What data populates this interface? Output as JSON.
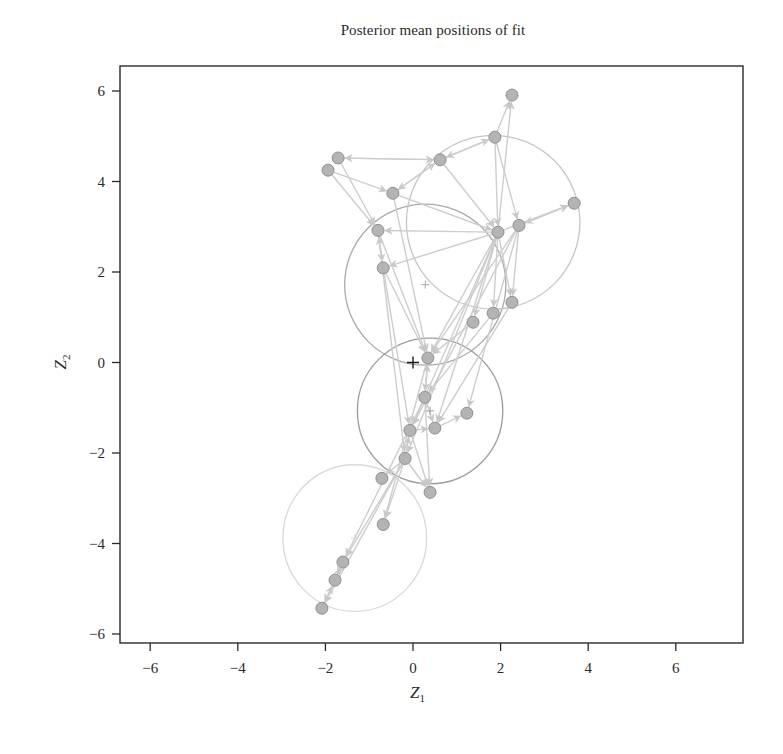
{
  "chart_data": {
    "type": "scatter",
    "title": "Posterior mean positions of fit",
    "xlabel": "Z",
    "xlabel_sub": "1",
    "ylabel": "Z",
    "ylabel_sub": "2",
    "xlim": [
      -6.75,
      7.6
    ],
    "ylim": [
      -6.25,
      6.3
    ],
    "xticks": [
      -6,
      -4,
      -2,
      0,
      2,
      4,
      6
    ],
    "yticks": [
      -6,
      -4,
      -2,
      0,
      2,
      4,
      6
    ],
    "grid": false,
    "legend": null,
    "origin_marker": {
      "x": 0,
      "y": 0,
      "symbol": "+"
    },
    "clusters": [
      {
        "center": [
          0.28,
          1.72
        ],
        "radius_x": 1.84,
        "radius_y": 1.78,
        "color": "#a9a9a9"
      },
      {
        "center": [
          1.83,
          3.1
        ],
        "radius_x": 1.98,
        "radius_y": 1.92,
        "color": "#c6c6c6"
      },
      {
        "center": [
          0.39,
          -1.07
        ],
        "radius_x": 1.66,
        "radius_y": 1.61,
        "color": "#9c9c9c"
      },
      {
        "center": [
          -1.33,
          -3.88
        ],
        "radius_x": 1.64,
        "radius_y": 1.62,
        "color": "#d9d9d9"
      }
    ],
    "nodes": [
      {
        "id": 0,
        "x": 2.26,
        "y": 5.91
      },
      {
        "id": 1,
        "x": 1.87,
        "y": 4.98
      },
      {
        "id": 2,
        "x": 0.62,
        "y": 4.48
      },
      {
        "id": 3,
        "x": -1.71,
        "y": 4.52
      },
      {
        "id": 4,
        "x": -1.94,
        "y": 4.25
      },
      {
        "id": 5,
        "x": -0.46,
        "y": 3.74
      },
      {
        "id": 6,
        "x": 3.68,
        "y": 3.52
      },
      {
        "id": 7,
        "x": 2.42,
        "y": 3.03
      },
      {
        "id": 8,
        "x": 1.94,
        "y": 2.88
      },
      {
        "id": 9,
        "x": -0.8,
        "y": 2.92
      },
      {
        "id": 10,
        "x": -0.68,
        "y": 2.09
      },
      {
        "id": 11,
        "x": 2.26,
        "y": 1.33
      },
      {
        "id": 12,
        "x": 1.83,
        "y": 1.09
      },
      {
        "id": 13,
        "x": 1.37,
        "y": 0.89
      },
      {
        "id": 14,
        "x": 0.34,
        "y": 0.1
      },
      {
        "id": 15,
        "x": 0.27,
        "y": -0.77
      },
      {
        "id": 16,
        "x": 1.23,
        "y": -1.12
      },
      {
        "id": 17,
        "x": 0.5,
        "y": -1.45
      },
      {
        "id": 18,
        "x": -0.07,
        "y": -1.5
      },
      {
        "id": 19,
        "x": -0.18,
        "y": -2.12
      },
      {
        "id": 20,
        "x": -0.71,
        "y": -2.56
      },
      {
        "id": 21,
        "x": 0.39,
        "y": -2.87
      },
      {
        "id": 22,
        "x": -0.68,
        "y": -3.58
      },
      {
        "id": 23,
        "x": -1.6,
        "y": -4.41
      },
      {
        "id": 24,
        "x": -1.78,
        "y": -4.81
      },
      {
        "id": 25,
        "x": -2.08,
        "y": -5.43
      }
    ],
    "edges": [
      [
        1,
        0
      ],
      [
        8,
        0
      ],
      [
        2,
        1
      ],
      [
        1,
        2
      ],
      [
        2,
        3
      ],
      [
        3,
        2
      ],
      [
        4,
        5
      ],
      [
        5,
        2
      ],
      [
        2,
        5
      ],
      [
        3,
        9
      ],
      [
        4,
        9
      ],
      [
        5,
        8
      ],
      [
        2,
        8
      ],
      [
        1,
        8
      ],
      [
        1,
        7
      ],
      [
        6,
        7
      ],
      [
        7,
        6
      ],
      [
        8,
        6
      ],
      [
        8,
        9
      ],
      [
        8,
        10
      ],
      [
        9,
        10
      ],
      [
        10,
        9
      ],
      [
        7,
        11
      ],
      [
        8,
        11
      ],
      [
        8,
        12
      ],
      [
        8,
        13
      ],
      [
        8,
        14
      ],
      [
        7,
        14
      ],
      [
        10,
        14
      ],
      [
        9,
        14
      ],
      [
        5,
        14
      ],
      [
        13,
        14
      ],
      [
        12,
        15
      ],
      [
        11,
        17
      ],
      [
        7,
        16
      ],
      [
        8,
        17
      ],
      [
        8,
        18
      ],
      [
        8,
        19
      ],
      [
        7,
        18
      ],
      [
        14,
        15
      ],
      [
        15,
        14
      ],
      [
        15,
        17
      ],
      [
        15,
        18
      ],
      [
        17,
        16
      ],
      [
        18,
        17
      ],
      [
        19,
        18
      ],
      [
        18,
        21
      ],
      [
        19,
        21
      ],
      [
        15,
        21
      ],
      [
        10,
        18
      ],
      [
        9,
        19
      ],
      [
        19,
        20
      ],
      [
        19,
        22
      ],
      [
        14,
        22
      ],
      [
        15,
        23
      ],
      [
        19,
        23
      ],
      [
        23,
        24
      ],
      [
        24,
        23
      ],
      [
        24,
        25
      ],
      [
        25,
        24
      ],
      [
        19,
        25
      ]
    ],
    "style": {
      "node_fill": "#b4b4b4",
      "node_stroke": "#8f8f8f",
      "node_radius": 6,
      "edge_color": "#cdcdcd",
      "axis_color": "#2a2a2a",
      "origin_color": "#1a1a1a"
    }
  }
}
